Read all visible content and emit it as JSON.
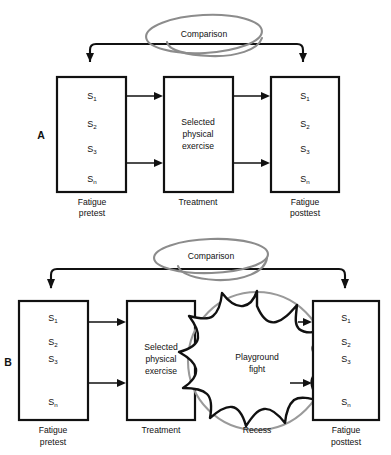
{
  "figure": {
    "title": "",
    "background_color": "#ffffff",
    "line_color": "#111111",
    "annotation_color": "#8c8c8c"
  },
  "panels": [
    {
      "id": "A",
      "panel_label": "A",
      "boxes": [
        {
          "name": "pretest",
          "caption_line1": "Fatigue",
          "caption_line2": "pretest",
          "subjects": [
            "S",
            "S",
            "S",
            "S"
          ],
          "subscripts": [
            "1",
            "2",
            "3",
            "n"
          ]
        },
        {
          "name": "treatment",
          "caption_line1": "Treatment",
          "caption_line2": "",
          "inner_lines": [
            "Selected",
            "physical",
            "exercise"
          ]
        },
        {
          "name": "posttest",
          "caption_line1": "Fatigue",
          "caption_line2": "posttest",
          "subjects": [
            "S",
            "S",
            "S",
            "S"
          ],
          "subscripts": [
            "1",
            "2",
            "3",
            "n"
          ]
        }
      ],
      "comparison_label": "Comparison"
    },
    {
      "id": "B",
      "panel_label": "B",
      "boxes": [
        {
          "name": "pretest",
          "caption_line1": "Fatigue",
          "caption_line2": "pretest",
          "subjects": [
            "S",
            "S",
            "S",
            "S"
          ],
          "subscripts": [
            "1",
            "2",
            "3",
            "n"
          ]
        },
        {
          "name": "treatment",
          "caption_line1": "Treatment",
          "caption_line2": "",
          "inner_lines": [
            "Selected",
            "physical",
            "exercise"
          ]
        },
        {
          "name": "posttest",
          "caption_line1": "Fatigue",
          "caption_line2": "posttest",
          "subjects": [
            "S",
            "S",
            "S",
            "S"
          ],
          "subscripts": [
            "1",
            "2",
            "3",
            "n"
          ]
        }
      ],
      "confound": {
        "name": "recess",
        "caption": "Recess",
        "burst_line1": "Playground",
        "burst_line2": "fight"
      },
      "comparison_label": "Comparison"
    }
  ]
}
